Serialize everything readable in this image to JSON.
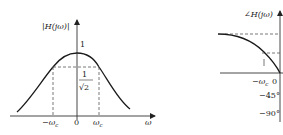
{
  "magnitude_plot": {
    "y_label": "|H(jω)|",
    "x_label": "ω",
    "peak_label": "1",
    "cutoff_label_num": "1",
    "cutoff_label_den": "√2",
    "x_ticks": [
      "−ω",
      "0",
      "ω"
    ],
    "tick_subscript": "c"
  },
  "phase_plot": {
    "y_label": "∠H(jω)",
    "x_ticks": [
      "−ω",
      "0"
    ],
    "tick_subscript": "c",
    "y_ticks": [
      "−45°",
      "−90°"
    ]
  },
  "colors": {
    "curve": "#1a1a1a",
    "axis": "#333333",
    "dashed": "#555555"
  }
}
